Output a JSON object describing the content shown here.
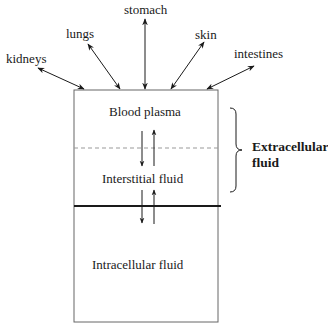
{
  "diagram": {
    "organs": [
      {
        "id": "kidneys",
        "label": "kidneys"
      },
      {
        "id": "lungs",
        "label": "lungs"
      },
      {
        "id": "stomach",
        "label": "stomach"
      },
      {
        "id": "skin",
        "label": "skin"
      },
      {
        "id": "intestines",
        "label": "intestines"
      }
    ],
    "compartments": {
      "blood_plasma": "Blood plasma",
      "interstitial": "Interstitial fluid",
      "intracellular": "Intracellular fluid"
    },
    "group": {
      "line1": "Extracellular",
      "line2": "fluid"
    },
    "colors": {
      "line": "#1a1a1a",
      "box_border": "#555555",
      "dashed": "#888888"
    }
  }
}
